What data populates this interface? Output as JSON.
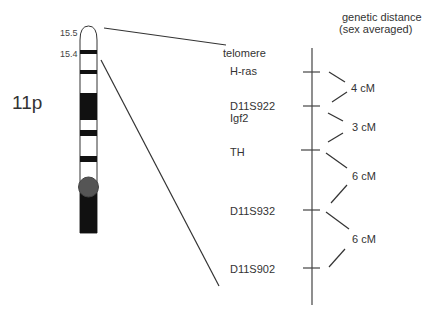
{
  "chromosome": {
    "arm_label": "11p",
    "band_labels": [
      "15.5",
      "15.4"
    ]
  },
  "map": {
    "header_line1": "genetic distance",
    "header_line2": "(sex averaged)",
    "telomere_label": "telomere",
    "markers": [
      {
        "name": "H-ras",
        "y": 71
      },
      {
        "name": "D11S922",
        "y": 104
      },
      {
        "name": "Igf2",
        "y": 104
      },
      {
        "name": "TH",
        "y": 150
      },
      {
        "name": "D11S932",
        "y": 210
      },
      {
        "name": "D11S902",
        "y": 268
      }
    ],
    "distances": [
      {
        "label": "4 cM"
      },
      {
        "label": "3 cM"
      },
      {
        "label": "6 cM"
      },
      {
        "label": "6 cM"
      }
    ]
  }
}
